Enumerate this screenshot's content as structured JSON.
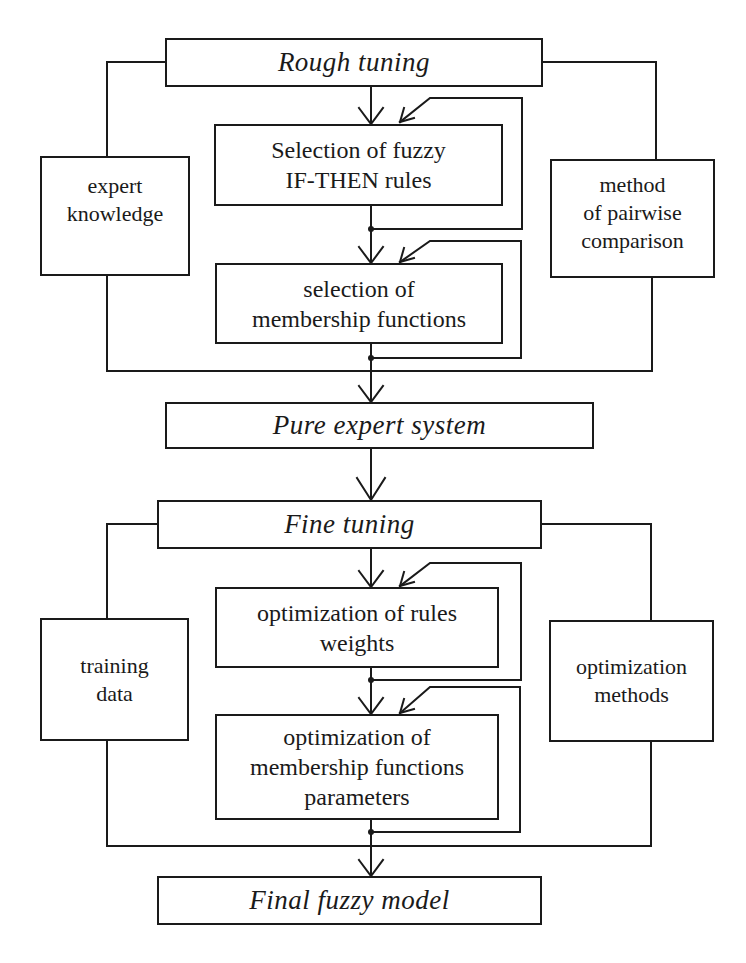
{
  "diagram": {
    "type": "flowchart",
    "stages": {
      "rough_tuning": "Rough tuning",
      "pure_expert_system": "Pure expert system",
      "fine_tuning": "Fine tuning",
      "final_fuzzy_model": "Final fuzzy model"
    },
    "rough_steps": {
      "step1_line1": "Selection of fuzzy",
      "step1_line2": "IF-THEN rules",
      "step2_line1": "selection of",
      "step2_line2": "membership functions"
    },
    "rough_inputs": {
      "left_line1": "expert",
      "left_line2": "knowledge",
      "right_line1": "method",
      "right_line2": "of pairwise",
      "right_line3": "comparison"
    },
    "fine_steps": {
      "step1_line1": "optimization of rules",
      "step1_line2": "weights",
      "step2_line1": "optimization of",
      "step2_line2": "membership functions",
      "step2_line3": "parameters"
    },
    "fine_inputs": {
      "left_line1": "training",
      "left_line2": "data",
      "right_line1": "optimization",
      "right_line2": "methods"
    },
    "colors": {
      "line": "#1a1a1a",
      "background": "#ffffff"
    }
  }
}
